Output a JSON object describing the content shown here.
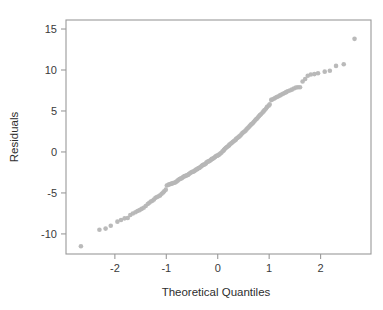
{
  "chart_data": {
    "type": "scatter",
    "title": "",
    "subtitle": "",
    "xlabel": "Theoretical Quantiles",
    "ylabel": "Residuals",
    "xlim": [
      -2.95,
      2.98
    ],
    "ylim": [
      -12.45,
      16.1
    ],
    "xticks": [
      -2,
      -1,
      0,
      1,
      2
    ],
    "xtick_labels": [
      "-2",
      "-1",
      "0",
      "1",
      "2"
    ],
    "yticks": [
      -10,
      -5,
      0,
      5,
      10,
      15
    ],
    "ytick_labels": [
      "-10",
      "-5",
      "0",
      "5",
      "10",
      "15"
    ],
    "grid": false,
    "legend": null,
    "marker": {
      "shape": "circle",
      "color": "#b6b6b6",
      "size": 4.6,
      "opacity": 0.95
    },
    "frame_color": "#9a9a9a",
    "background": "#ffffff",
    "series": [
      {
        "name": "residual-quantiles",
        "points": [
          [
            -2.66,
            -11.5
          ],
          [
            -2.3,
            -9.5
          ],
          [
            -2.18,
            -9.35
          ],
          [
            -2.08,
            -9.0
          ],
          [
            -1.95,
            -8.5
          ],
          [
            -1.88,
            -8.3
          ],
          [
            -1.81,
            -8.1
          ],
          [
            -1.75,
            -8.05
          ],
          [
            -1.7,
            -7.7
          ],
          [
            -1.65,
            -7.5
          ],
          [
            -1.6,
            -7.35
          ],
          [
            -1.56,
            -7.2
          ],
          [
            -1.52,
            -7.1
          ],
          [
            -1.48,
            -6.95
          ],
          [
            -1.44,
            -6.8
          ],
          [
            -1.4,
            -6.6
          ],
          [
            -1.36,
            -6.35
          ],
          [
            -1.33,
            -6.2
          ],
          [
            -1.3,
            -6.05
          ],
          [
            -1.27,
            -5.95
          ],
          [
            -1.24,
            -5.8
          ],
          [
            -1.21,
            -5.6
          ],
          [
            -1.18,
            -5.5
          ],
          [
            -1.15,
            -5.4
          ],
          [
            -1.12,
            -5.3
          ],
          [
            -1.09,
            -5.1
          ],
          [
            -1.06,
            -4.95
          ],
          [
            -1.04,
            -4.8
          ],
          [
            -1.01,
            -4.6
          ],
          [
            -0.99,
            -4.1
          ],
          [
            -0.96,
            -4.0
          ],
          [
            -0.94,
            -3.95
          ],
          [
            -0.91,
            -3.9
          ],
          [
            -0.89,
            -3.85
          ],
          [
            -0.87,
            -3.8
          ],
          [
            -0.84,
            -3.75
          ],
          [
            -0.82,
            -3.7
          ],
          [
            -0.8,
            -3.6
          ],
          [
            -0.78,
            -3.5
          ],
          [
            -0.76,
            -3.4
          ],
          [
            -0.74,
            -3.3
          ],
          [
            -0.72,
            -3.25
          ],
          [
            -0.7,
            -3.2
          ],
          [
            -0.68,
            -3.1
          ],
          [
            -0.66,
            -3.0
          ],
          [
            -0.64,
            -2.95
          ],
          [
            -0.62,
            -2.9
          ],
          [
            -0.6,
            -2.85
          ],
          [
            -0.58,
            -2.8
          ],
          [
            -0.56,
            -2.7
          ],
          [
            -0.54,
            -2.6
          ],
          [
            -0.52,
            -2.5
          ],
          [
            -0.5,
            -2.45
          ],
          [
            -0.48,
            -2.4
          ],
          [
            -0.46,
            -2.35
          ],
          [
            -0.44,
            -2.25
          ],
          [
            -0.42,
            -2.15
          ],
          [
            -0.4,
            -2.1
          ],
          [
            -0.38,
            -2.0
          ],
          [
            -0.36,
            -1.95
          ],
          [
            -0.35,
            -1.9
          ],
          [
            -0.33,
            -1.8
          ],
          [
            -0.31,
            -1.7
          ],
          [
            -0.29,
            -1.6
          ],
          [
            -0.27,
            -1.55
          ],
          [
            -0.25,
            -1.5
          ],
          [
            -0.23,
            -1.4
          ],
          [
            -0.22,
            -1.3
          ],
          [
            -0.2,
            -1.2
          ],
          [
            -0.18,
            -1.15
          ],
          [
            -0.16,
            -1.1
          ],
          [
            -0.14,
            -1.0
          ],
          [
            -0.12,
            -0.9
          ],
          [
            -0.11,
            -0.85
          ],
          [
            -0.09,
            -0.8
          ],
          [
            -0.07,
            -0.7
          ],
          [
            -0.05,
            -0.6
          ],
          [
            -0.03,
            -0.5
          ],
          [
            -0.01,
            -0.45
          ],
          [
            0.01,
            -0.4
          ],
          [
            0.03,
            -0.3
          ],
          [
            0.05,
            -0.2
          ],
          [
            0.07,
            -0.1
          ],
          [
            0.09,
            0.05
          ],
          [
            0.11,
            0.15
          ],
          [
            0.12,
            0.25
          ],
          [
            0.14,
            0.4
          ],
          [
            0.16,
            0.5
          ],
          [
            0.18,
            0.6
          ],
          [
            0.2,
            0.7
          ],
          [
            0.22,
            0.8
          ],
          [
            0.23,
            0.9
          ],
          [
            0.25,
            1.0
          ],
          [
            0.27,
            1.1
          ],
          [
            0.29,
            1.2
          ],
          [
            0.31,
            1.3
          ],
          [
            0.33,
            1.4
          ],
          [
            0.35,
            1.5
          ],
          [
            0.36,
            1.6
          ],
          [
            0.38,
            1.7
          ],
          [
            0.4,
            1.8
          ],
          [
            0.42,
            1.9
          ],
          [
            0.44,
            2.0
          ],
          [
            0.46,
            2.15
          ],
          [
            0.48,
            2.3
          ],
          [
            0.5,
            2.4
          ],
          [
            0.52,
            2.5
          ],
          [
            0.54,
            2.6
          ],
          [
            0.56,
            2.75
          ],
          [
            0.58,
            2.9
          ],
          [
            0.6,
            3.0
          ],
          [
            0.62,
            3.15
          ],
          [
            0.64,
            3.3
          ],
          [
            0.66,
            3.4
          ],
          [
            0.68,
            3.5
          ],
          [
            0.7,
            3.65
          ],
          [
            0.72,
            3.8
          ],
          [
            0.74,
            3.95
          ],
          [
            0.76,
            4.05
          ],
          [
            0.78,
            4.2
          ],
          [
            0.8,
            4.35
          ],
          [
            0.82,
            4.5
          ],
          [
            0.84,
            4.6
          ],
          [
            0.87,
            4.8
          ],
          [
            0.89,
            4.95
          ],
          [
            0.91,
            5.1
          ],
          [
            0.94,
            5.3
          ],
          [
            0.96,
            5.5
          ],
          [
            0.99,
            5.65
          ],
          [
            1.01,
            5.8
          ],
          [
            1.04,
            6.35
          ],
          [
            1.06,
            6.4
          ],
          [
            1.09,
            6.5
          ],
          [
            1.12,
            6.6
          ],
          [
            1.15,
            6.7
          ],
          [
            1.18,
            6.8
          ],
          [
            1.21,
            6.9
          ],
          [
            1.24,
            7.0
          ],
          [
            1.27,
            7.1
          ],
          [
            1.3,
            7.2
          ],
          [
            1.33,
            7.3
          ],
          [
            1.36,
            7.4
          ],
          [
            1.4,
            7.5
          ],
          [
            1.44,
            7.6
          ],
          [
            1.48,
            7.75
          ],
          [
            1.52,
            7.85
          ],
          [
            1.56,
            7.9
          ],
          [
            1.6,
            7.9
          ],
          [
            1.65,
            8.6
          ],
          [
            1.7,
            8.9
          ],
          [
            1.75,
            9.3
          ],
          [
            1.81,
            9.45
          ],
          [
            1.88,
            9.5
          ],
          [
            1.95,
            9.6
          ],
          [
            2.08,
            9.8
          ],
          [
            2.18,
            9.9
          ],
          [
            2.3,
            10.5
          ],
          [
            2.45,
            10.7
          ],
          [
            2.66,
            13.8
          ]
        ]
      }
    ]
  }
}
